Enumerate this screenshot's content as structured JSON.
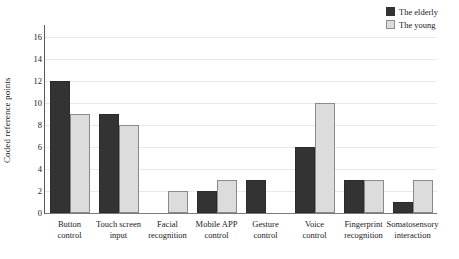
{
  "chart_data": {
    "type": "bar",
    "title": "",
    "subtitle": "",
    "xlabel": "",
    "ylabel": "Coded reference points",
    "ylim": [
      0,
      16
    ],
    "ytick_step": 2,
    "yticks": [
      "16",
      "14",
      "12",
      "10",
      "8",
      "6",
      "4",
      "2",
      "0"
    ],
    "grid": true,
    "legend_position": "top-right",
    "orientation": "vertical",
    "grouping": "grouped",
    "categories": [
      "Button control",
      "Touch screen input",
      "Facial recognition",
      "Mobile APP control",
      "Gesture control",
      "Voice control",
      "Fingerprint recognition",
      "Somatosensory interaction"
    ],
    "category_lines": [
      [
        "Button",
        "control"
      ],
      [
        "Touch screen",
        "input"
      ],
      [
        "Facial",
        "recognition"
      ],
      [
        "Mobile APP",
        "control"
      ],
      [
        "Gesture",
        "control"
      ],
      [
        "Voice",
        "control"
      ],
      [
        "Fingerprint",
        "recognition"
      ],
      [
        "Somatosensory",
        "interaction"
      ]
    ],
    "series": [
      {
        "name": "The elderly",
        "color": "#333333",
        "border": "#2b2b2b",
        "values": [
          12,
          9,
          0,
          2,
          3,
          6,
          3,
          1
        ]
      },
      {
        "name": "The young",
        "color": "#dcdcdc",
        "border": "#8a8a8a",
        "values": [
          9,
          8,
          2,
          3,
          0,
          10,
          3,
          3
        ]
      }
    ]
  },
  "legend": {
    "items": [
      {
        "label": "The elderly",
        "swatch": "elderly"
      },
      {
        "label": "The young",
        "swatch": "young"
      }
    ]
  },
  "axis": {
    "y_title": "Coded reference points"
  },
  "colors": {
    "elderly": "#333333",
    "young": "#dcdcdc",
    "gridline": "#e9e9e9",
    "axis": "#595959",
    "text": "#1a1a1a",
    "background": "#ffffff"
  }
}
